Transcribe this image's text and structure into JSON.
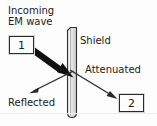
{
  "diagram": {
    "type": "schematic",
    "canvas": {
      "width": 157,
      "height": 126,
      "background": "#fdfdfd"
    },
    "labels": {
      "incoming": "Incoming\nEM wave",
      "incoming_line1": "Incoming",
      "incoming_line2": "EM wave",
      "shield": "Shield",
      "attenuated": "Attenuated",
      "reflected": "Reflected"
    },
    "ports": [
      {
        "id": "port-1",
        "label": "1",
        "role": "source-port"
      },
      {
        "id": "port-2",
        "label": "2",
        "role": "receive-port"
      }
    ],
    "shield_barrier": {
      "name": "shield-barrier",
      "orientation": "vertical",
      "fill": "#e8e8e8",
      "stroke": "#2a2a2a"
    },
    "arrows": [
      {
        "name": "incoming-wave-arrow",
        "label": "Incoming EM wave",
        "style": "thick-solid",
        "color": "#111111",
        "from": [
          34,
          49
        ],
        "to": [
          73,
          77
        ]
      },
      {
        "name": "reflected-wave-arrow",
        "label": "Reflected",
        "style": "thin-solid",
        "color": "#2a2a2a",
        "from": [
          73,
          72
        ],
        "to": [
          30,
          93
        ]
      },
      {
        "name": "attenuated-wave-arrow",
        "label": "Attenuated",
        "style": "thin-solid",
        "color": "#2a2a2a",
        "from": [
          71,
          71
        ],
        "to": [
          117,
          99
        ]
      }
    ],
    "colors": {
      "ink": "#1b1b1b",
      "arrow": "#111111",
      "shield_fill": "#e8e8e8",
      "box_border": "#2a2a2a",
      "background": "#fdfdfd"
    }
  }
}
